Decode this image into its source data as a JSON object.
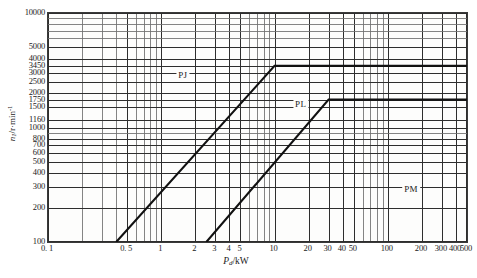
{
  "chart_data": {
    "type": "line",
    "title": "",
    "xlabel": "Pd/kW",
    "ylabel": "n1/r·min-1",
    "xscale": "log",
    "yscale": "log",
    "xlim": [
      0.1,
      500
    ],
    "ylim": [
      100,
      10000
    ],
    "grid": true,
    "legend": "inline-annotations",
    "x_ticks": [
      {
        "value": 0.1,
        "label": "0. 1"
      },
      {
        "value": 0.5,
        "label": "0. 5"
      },
      {
        "value": 1,
        "label": "1"
      },
      {
        "value": 2,
        "label": "2"
      },
      {
        "value": 3,
        "label": "3"
      },
      {
        "value": 4,
        "label": "4"
      },
      {
        "value": 5,
        "label": "5"
      },
      {
        "value": 10,
        "label": "10"
      },
      {
        "value": 20,
        "label": "20"
      },
      {
        "value": 30,
        "label": "30"
      },
      {
        "value": 40,
        "label": "40"
      },
      {
        "value": 50,
        "label": "50"
      },
      {
        "value": 100,
        "label": "100"
      },
      {
        "value": 200,
        "label": "200"
      },
      {
        "value": 300,
        "label": "300"
      },
      {
        "value": 400,
        "label": "400"
      },
      {
        "value": 500,
        "label": "500"
      }
    ],
    "y_ticks": [
      {
        "value": 10000,
        "label": "10000"
      },
      {
        "value": 5000,
        "label": "5000"
      },
      {
        "value": 4000,
        "label": "4000"
      },
      {
        "value": 3450,
        "label": "3450"
      },
      {
        "value": 3000,
        "label": "3000"
      },
      {
        "value": 2500,
        "label": "2500"
      },
      {
        "value": 2000,
        "label": "2000"
      },
      {
        "value": 1750,
        "label": "1750"
      },
      {
        "value": 1500,
        "label": "1500"
      },
      {
        "value": 1160,
        "label": "1160"
      },
      {
        "value": 1000,
        "label": "1000"
      },
      {
        "value": 800,
        "label": "800"
      },
      {
        "value": 700,
        "label": "700"
      },
      {
        "value": 600,
        "label": "600"
      },
      {
        "value": 500,
        "label": "500"
      },
      {
        "value": 400,
        "label": "400"
      },
      {
        "value": 300,
        "label": "300"
      },
      {
        "value": 200,
        "label": "200"
      },
      {
        "value": 100,
        "label": "100"
      }
    ],
    "series": [
      {
        "name": "PJ",
        "label": "PJ",
        "color": "#111111",
        "label_x": 1.55,
        "label_y": 2900,
        "points": [
          {
            "x": 0.4,
            "y": 100
          },
          {
            "x": 10.0,
            "y": 3450
          },
          {
            "x": 500.0,
            "y": 3450
          }
        ]
      },
      {
        "name": "PL",
        "label": "PL",
        "color": "#111111",
        "label_x": 17.0,
        "label_y": 1620,
        "points": [
          {
            "x": 2.5,
            "y": 100
          },
          {
            "x": 30.0,
            "y": 1750
          },
          {
            "x": 500.0,
            "y": 1750
          }
        ]
      },
      {
        "name": "PM",
        "label": "PM",
        "color": "#111111",
        "label_x": 160.0,
        "label_y": 290,
        "points": []
      }
    ]
  }
}
